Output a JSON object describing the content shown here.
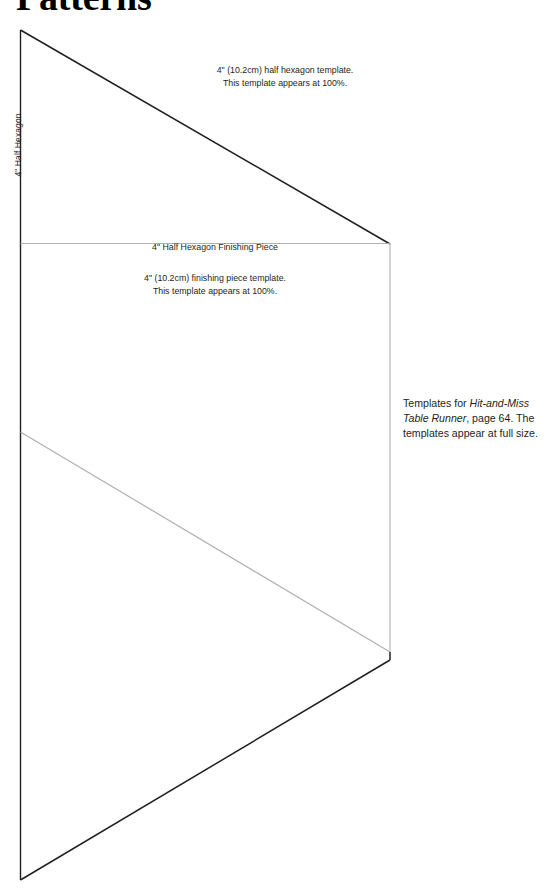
{
  "page": {
    "title": "Patterns"
  },
  "side_label": {
    "text": "4\" Half Hexagon"
  },
  "captions": {
    "half_hexagon": {
      "line1": "4\" (10.2cm) half hexagon template.",
      "line2": "This template appears at 100%."
    },
    "finishing_piece_title": "4\" Half Hexagon Finishing Piece",
    "finishing_piece": {
      "line1": "4\" (10.2cm) finishing piece template.",
      "line2": "This template appears at 100%."
    }
  },
  "side_note": {
    "lead": "Templates for ",
    "project_title": "Hit-and-Miss Table Runner",
    "tail": ", page 64. The templates appear at full size."
  },
  "colors": {
    "ink": "#231f20",
    "line_dark": "#231f20",
    "line_light": "#b0b0b0",
    "page_background": "#ffffff"
  },
  "geometry": {
    "half_hexagon_template": {
      "apex_top": [
        20,
        30
      ],
      "right_vertex": [
        390,
        244
      ],
      "left_bottom": [
        20,
        244
      ]
    },
    "finishing_piece_template": {
      "top_left": [
        20,
        244
      ],
      "top_right": [
        390,
        244
      ],
      "bottom_right": [
        390,
        652
      ],
      "left_mid": [
        20,
        432
      ]
    },
    "lower_half_hexagon": {
      "left_top": [
        20,
        432
      ],
      "right_vertex": [
        390,
        660
      ],
      "left_bottom": [
        20,
        880
      ]
    }
  }
}
